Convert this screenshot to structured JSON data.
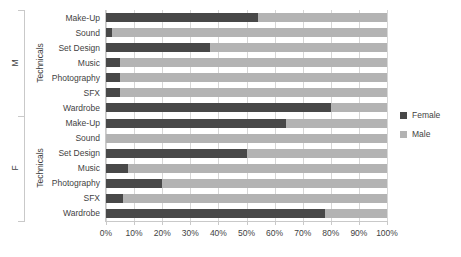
{
  "chart_data": {
    "type": "bar",
    "subtype": "100%-stacked-horizontal-bar",
    "title": "",
    "xlabel": "",
    "ylabel": "",
    "xlim": [
      0,
      100
    ],
    "grid": true,
    "legend_position": "right",
    "x_tick_labels": [
      "0%",
      "10%",
      "20%",
      "30%",
      "40%",
      "50%",
      "60%",
      "70%",
      "80%",
      "90%",
      "100%"
    ],
    "x_tick_values": [
      0,
      10,
      20,
      30,
      40,
      50,
      60,
      70,
      80,
      90,
      100
    ],
    "series": [
      {
        "name": "Female",
        "color": "#484848"
      },
      {
        "name": "Male",
        "color": "#b3b3b3"
      }
    ],
    "groups": [
      {
        "group_label": "M",
        "group_sublabel": "Technicals",
        "categories": [
          "Make-Up",
          "Sound",
          "Set Design",
          "Music",
          "Photography",
          "SFX",
          "Wardrobe"
        ],
        "values": {
          "Female": [
            54,
            2,
            37,
            5,
            5,
            5,
            80
          ],
          "Male": [
            46,
            98,
            63,
            95,
            95,
            95,
            20
          ]
        }
      },
      {
        "group_label": "F",
        "group_sublabel": "Technicals",
        "categories": [
          "Make-Up",
          "Sound",
          "Set Design",
          "Music",
          "Photography",
          "SFX",
          "Wardrobe"
        ],
        "values": {
          "Female": [
            64,
            0,
            50,
            8,
            20,
            6,
            78
          ],
          "Male": [
            36,
            100,
            50,
            92,
            80,
            94,
            22
          ]
        }
      }
    ]
  },
  "legend": {
    "items": [
      {
        "label": "Female",
        "color": "#484848"
      },
      {
        "label": "Male",
        "color": "#b3b3b3"
      }
    ]
  }
}
